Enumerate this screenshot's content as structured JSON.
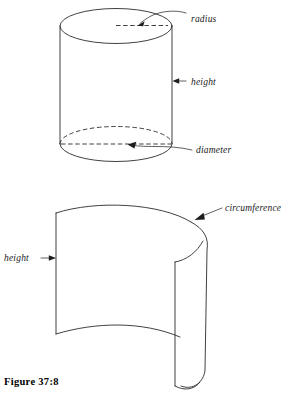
{
  "figure": {
    "caption": "Figure 37:8",
    "upper_diagram": {
      "name": "cylinder",
      "labels": {
        "radius": "radius",
        "height": "height",
        "diameter": "diameter"
      }
    },
    "lower_diagram": {
      "name": "unrolled-cylinder-surface",
      "labels": {
        "height": "height",
        "circumference": "circumference"
      }
    }
  },
  "colors": {
    "ink": "#2b2b2b",
    "paper": "#ffffff",
    "arrow": "#1d1d1d"
  }
}
